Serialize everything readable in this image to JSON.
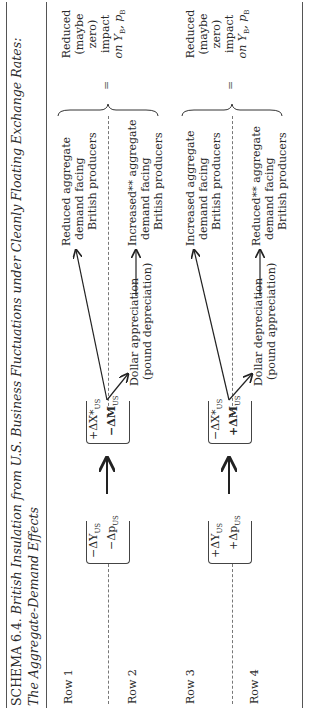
{
  "title": {
    "label": "SCHEMA 6.4.",
    "text_line1": "British Insulation from U.S. Business Fluctuations under Cleanly Floating Exchange Rates:",
    "text_line2": "The Aggregate-Demand Effects"
  },
  "rows": [
    {
      "label": "Row 1"
    },
    {
      "label": "Row 2"
    },
    {
      "label": "Row 3"
    },
    {
      "label": "Row 4"
    }
  ],
  "block1": {
    "shock": [
      "−ΔY",
      "−Δp"
    ],
    "shock_sub": "US",
    "trade": [
      "+ΔX*",
      "−ΔM"
    ],
    "trade_sub": "US",
    "effect_top": [
      "Reduced aggregate",
      "demand facing",
      "British producers"
    ],
    "fx": [
      "Dollar appreciation",
      "(pound depreciation)"
    ],
    "effect_bottom": [
      "Increased** aggregate",
      "demand facing",
      "British producers"
    ],
    "eq": "=",
    "result": [
      "Reduced",
      "(maybe",
      "zero)",
      "impact",
      "on Y",
      "B",
      ", p",
      "B"
    ]
  },
  "block2": {
    "shock": [
      "+ΔY",
      "+Δp"
    ],
    "shock_sub": "US",
    "trade": [
      "−ΔX*",
      "+ΔM"
    ],
    "trade_sub": "US",
    "effect_top": [
      "Increased aggregate",
      "demand facing",
      "British producers"
    ],
    "fx": [
      "Dollar depreciation",
      "(pound appreciation)"
    ],
    "effect_bottom": [
      "Reduced** aggregate",
      "demand facing",
      "British producers"
    ],
    "eq": "=",
    "result": [
      "Reduced",
      "(maybe",
      "zero)",
      "impact",
      "on Y",
      "B",
      ", p",
      "B"
    ]
  }
}
